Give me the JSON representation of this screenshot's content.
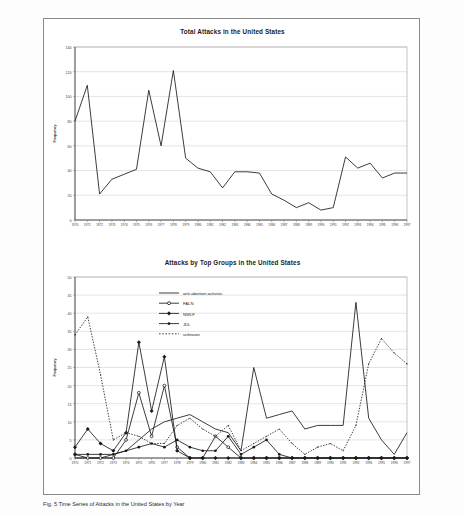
{
  "figure": {
    "caption_line1": "Figure 5. Time series of attacks over Time in the United States (top) and by top groups (bottom).",
    "caption_visible_fragment": "Fig. 5 Time Series of Attacks in the United States by Year"
  },
  "chart_data": [
    {
      "id": "total-attacks",
      "type": "line",
      "title": "Total Attacks in the United States",
      "xlabel": "",
      "ylabel": "Frequency",
      "ylim": [
        0,
        140
      ],
      "ytick_step": 20,
      "yticks": [
        0,
        20,
        40,
        60,
        80,
        100,
        120,
        140
      ],
      "grid": true,
      "legend": "none",
      "x": [
        1970,
        1971,
        1972,
        1973,
        1974,
        1975,
        1976,
        1977,
        1978,
        1979,
        1980,
        1981,
        1982,
        1983,
        1984,
        1985,
        1986,
        1987,
        1988,
        1989,
        1990,
        1991,
        1992,
        1993,
        1994,
        1995,
        1996,
        1997
      ],
      "xtick_labels": [
        "1970",
        "1971",
        "1972",
        "1973",
        "1974",
        "1975",
        "1976",
        "1977",
        "1978",
        "1979",
        "1980",
        "1981",
        "1982",
        "1983",
        "1984",
        "1985",
        "1986",
        "1987",
        "1988",
        "1989",
        "1990",
        "1991",
        "1992",
        "1993",
        "1994",
        "1995",
        "1996",
        "1997"
      ],
      "series": [
        {
          "name": "Total attacks",
          "color": "#1a1a1a",
          "marker": "none",
          "dash": "solid",
          "values": [
            80,
            109,
            21,
            33,
            37,
            41,
            105,
            60,
            121,
            50,
            42,
            39,
            26,
            39,
            39,
            38,
            21,
            16,
            10,
            14,
            8,
            10,
            51,
            42,
            46,
            34,
            38,
            38
          ]
        }
      ]
    },
    {
      "id": "attacks-by-top-groups",
      "type": "line",
      "title": "Attacks by Top Groups in the United States",
      "xlabel": "",
      "ylabel": "Frequency",
      "ylim": [
        0,
        50
      ],
      "ytick_step": 5,
      "yticks": [
        0,
        5,
        10,
        15,
        20,
        25,
        30,
        35,
        40,
        45,
        50
      ],
      "grid": true,
      "legend": "inside-top-center",
      "x": [
        1970,
        1971,
        1972,
        1973,
        1974,
        1975,
        1976,
        1977,
        1978,
        1979,
        1980,
        1981,
        1982,
        1983,
        1984,
        1985,
        1986,
        1987,
        1988,
        1989,
        1990,
        1991,
        1992,
        1994,
        1995,
        1996,
        1997
      ],
      "xtick_labels": [
        "1970",
        "1971",
        "1972",
        "1973",
        "1974",
        "1975",
        "1976",
        "1977",
        "1978",
        "1979",
        "1980",
        "1981",
        "1982",
        "1983",
        "1984",
        "1985",
        "1986",
        "1987",
        "1988",
        "1989",
        "1990",
        "1991",
        "1992",
        "1994",
        "1995",
        "1996",
        "1997"
      ],
      "series": [
        {
          "name": "anti-abortion activists",
          "legend_label": "anti-abortion activists",
          "color": "#1a1a1a",
          "marker": "none",
          "dash": "solid",
          "values": [
            0,
            0,
            0,
            1,
            2,
            5,
            8,
            10,
            11,
            12,
            10,
            8,
            7,
            2,
            25,
            11,
            12,
            13,
            8,
            9,
            9,
            9,
            43,
            11,
            5,
            1,
            7
          ]
        },
        {
          "name": "FALN",
          "legend_label": "FALN",
          "color": "#1a1a1a",
          "marker": "open-circle",
          "dash": "solid",
          "values": [
            1,
            0,
            0,
            0,
            5,
            18,
            6,
            20,
            3,
            0,
            0,
            6,
            3,
            0,
            0,
            0,
            0,
            0,
            0,
            0,
            0,
            0,
            0,
            0,
            0,
            0,
            0
          ]
        },
        {
          "name": "NWLF",
          "legend_label": "NWLF",
          "color": "#1a1a1a",
          "marker": "diamond",
          "dash": "solid",
          "values": [
            3,
            8,
            4,
            2,
            7,
            32,
            13,
            28,
            2,
            0,
            0,
            0,
            0,
            0,
            0,
            0,
            0,
            0,
            0,
            0,
            0,
            0,
            0,
            0,
            0,
            0,
            0
          ]
        },
        {
          "name": "JDL",
          "legend_label": "JDL",
          "color": "#1a1a1a",
          "marker": "filled-circle",
          "dash": "solid",
          "values": [
            1,
            1,
            1,
            1,
            2,
            3,
            4,
            3,
            5,
            3,
            2,
            2,
            6,
            1,
            3,
            5,
            1,
            0,
            0,
            0,
            0,
            0,
            0,
            0,
            0,
            0,
            0
          ]
        },
        {
          "name": "unknown",
          "legend_label": "unknown",
          "color": "#1a1a1a",
          "marker": "dot",
          "dash": "dotted",
          "values": [
            34,
            39,
            23,
            5,
            7,
            6,
            4,
            4,
            9,
            11,
            8,
            6,
            9,
            2,
            4,
            6,
            8,
            4,
            1,
            3,
            4,
            2,
            9,
            26,
            33,
            29,
            26
          ]
        }
      ]
    }
  ]
}
